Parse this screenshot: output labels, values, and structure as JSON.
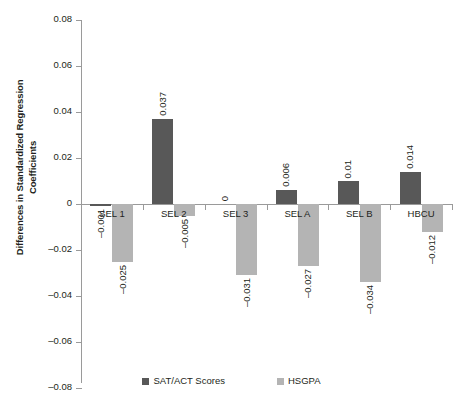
{
  "chart_data": {
    "type": "bar",
    "title": "",
    "xlabel": "",
    "ylabel": "Differences in Standardized Regression Coefficients",
    "ylim": [
      -0.08,
      0.08
    ],
    "ytick_labels": [
      "0.08",
      "0.06",
      "0.04",
      "0.02",
      "0",
      "–0.02",
      "–0.04",
      "–0.06",
      "–0.08"
    ],
    "ytick_values": [
      0.08,
      0.06,
      0.04,
      0.02,
      0,
      -0.02,
      -0.04,
      -0.06,
      -0.08
    ],
    "grid": false,
    "legend_position": "bottom",
    "categories": [
      "SEL 1",
      "SEL 2",
      "SEL 3",
      "SEL A",
      "SEL B",
      "HBCU"
    ],
    "series": [
      {
        "name": "SAT/ACT Scores",
        "color": "#585858",
        "values": [
          -0.001,
          0.037,
          0,
          0.006,
          0.01,
          0.014
        ],
        "labels": [
          "–0.001",
          "0.037",
          "0",
          "0.006",
          "0.01",
          "0.014"
        ]
      },
      {
        "name": "HSGPA",
        "color": "#b4b4b4",
        "values": [
          -0.025,
          -0.005,
          -0.031,
          -0.027,
          -0.034,
          -0.012
        ],
        "labels": [
          "–0.025",
          "–0.005",
          "–0.031",
          "–0.027",
          "–0.034",
          "–0.012"
        ]
      }
    ]
  },
  "legend": {
    "items": [
      {
        "label": "SAT/ACT Scores",
        "swatch": "dark"
      },
      {
        "label": "HSGPA",
        "swatch": "light"
      }
    ]
  }
}
